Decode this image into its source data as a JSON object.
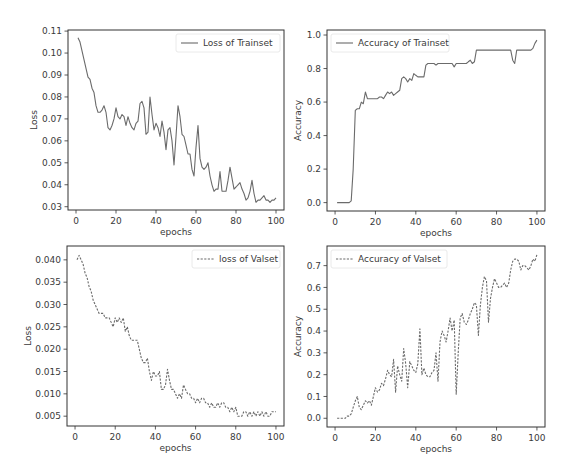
{
  "chart_data": [
    {
      "id": "train_loss",
      "type": "line",
      "title": "",
      "xlabel": "epochs",
      "ylabel": "Loss",
      "legend": {
        "label": "Loss of Trainset",
        "position": "upper right",
        "linestyle": "solid"
      },
      "xlim": [
        -4,
        104
      ],
      "ylim": [
        0.0285,
        0.1105
      ],
      "xticks": [
        0,
        20,
        40,
        60,
        80,
        100
      ],
      "yticks": [
        0.03,
        0.04,
        0.05,
        0.06,
        0.07,
        0.08,
        0.09,
        0.1,
        0.11
      ],
      "ytick_labels": [
        "0.03",
        "0.04",
        "0.05",
        "0.06",
        "0.07",
        "0.08",
        "0.09",
        "0.10",
        "0.11"
      ],
      "grid": false,
      "series": [
        {
          "name": "Loss of Trainset",
          "x": [
            1,
            2,
            3,
            4,
            5,
            6,
            7,
            8,
            9,
            10,
            11,
            12,
            13,
            14,
            15,
            16,
            17,
            18,
            19,
            20,
            21,
            22,
            23,
            24,
            25,
            26,
            27,
            28,
            29,
            30,
            31,
            32,
            33,
            34,
            35,
            36,
            37,
            38,
            39,
            40,
            41,
            42,
            43,
            44,
            45,
            46,
            47,
            48,
            49,
            50,
            51,
            52,
            53,
            54,
            55,
            56,
            57,
            58,
            59,
            60,
            61,
            62,
            63,
            64,
            65,
            66,
            67,
            68,
            69,
            70,
            71,
            72,
            73,
            74,
            75,
            76,
            77,
            78,
            79,
            80,
            81,
            82,
            83,
            84,
            85,
            86,
            87,
            88,
            89,
            90,
            91,
            92,
            93,
            94,
            95,
            96,
            97,
            98,
            99,
            100
          ],
          "y": [
            0.107,
            0.105,
            0.101,
            0.097,
            0.093,
            0.089,
            0.088,
            0.084,
            0.082,
            0.076,
            0.073,
            0.073,
            0.074,
            0.076,
            0.073,
            0.066,
            0.065,
            0.067,
            0.07,
            0.075,
            0.071,
            0.07,
            0.072,
            0.071,
            0.067,
            0.071,
            0.068,
            0.066,
            0.065,
            0.068,
            0.069,
            0.077,
            0.078,
            0.075,
            0.063,
            0.064,
            0.08,
            0.072,
            0.065,
            0.068,
            0.066,
            0.062,
            0.069,
            0.064,
            0.056,
            0.065,
            0.066,
            0.06,
            0.049,
            0.062,
            0.076,
            0.071,
            0.063,
            0.062,
            0.058,
            0.054,
            0.054,
            0.047,
            0.044,
            0.057,
            0.067,
            0.052,
            0.048,
            0.047,
            0.048,
            0.05,
            0.044,
            0.04,
            0.037,
            0.038,
            0.038,
            0.046,
            0.037,
            0.037,
            0.037,
            0.042,
            0.048,
            0.043,
            0.038,
            0.039,
            0.04,
            0.041,
            0.038,
            0.036,
            0.033,
            0.034,
            0.037,
            0.042,
            0.036,
            0.032,
            0.033,
            0.033,
            0.034,
            0.035,
            0.033,
            0.033,
            0.032,
            0.033,
            0.033,
            0.034
          ]
        }
      ]
    },
    {
      "id": "train_acc",
      "type": "line",
      "title": "",
      "xlabel": "epochs",
      "ylabel": "Accuracy",
      "legend": {
        "label": "Accuracy of Trainset",
        "position": "upper left",
        "linestyle": "solid"
      },
      "xlim": [
        -4,
        104
      ],
      "ylim": [
        -0.05,
        1.03
      ],
      "xticks": [
        0,
        20,
        40,
        60,
        80,
        100
      ],
      "yticks": [
        0.0,
        0.2,
        0.4,
        0.6,
        0.8,
        1.0
      ],
      "ytick_labels": [
        "0.0",
        "0.2",
        "0.4",
        "0.6",
        "0.8",
        "1.0"
      ],
      "grid": false,
      "series": [
        {
          "name": "Accuracy of Trainset",
          "x": [
            1,
            2,
            3,
            4,
            5,
            6,
            7,
            8,
            9,
            10,
            11,
            12,
            13,
            14,
            15,
            16,
            17,
            18,
            19,
            20,
            21,
            22,
            23,
            24,
            25,
            26,
            27,
            28,
            29,
            30,
            31,
            32,
            33,
            34,
            35,
            36,
            37,
            38,
            39,
            40,
            41,
            42,
            43,
            44,
            45,
            46,
            47,
            48,
            49,
            50,
            51,
            52,
            53,
            54,
            55,
            56,
            57,
            58,
            59,
            60,
            61,
            62,
            63,
            64,
            65,
            66,
            67,
            68,
            69,
            70,
            71,
            72,
            73,
            74,
            75,
            76,
            77,
            78,
            79,
            80,
            81,
            82,
            83,
            84,
            85,
            86,
            87,
            88,
            89,
            90,
            91,
            92,
            93,
            94,
            95,
            96,
            97,
            98,
            99,
            100
          ],
          "y": [
            0.0,
            0.0,
            0.0,
            0.0,
            0.0,
            0.0,
            0.0,
            0.01,
            0.2,
            0.55,
            0.56,
            0.56,
            0.6,
            0.59,
            0.66,
            0.62,
            0.62,
            0.62,
            0.62,
            0.62,
            0.62,
            0.63,
            0.63,
            0.62,
            0.64,
            0.66,
            0.65,
            0.66,
            0.64,
            0.65,
            0.66,
            0.67,
            0.74,
            0.75,
            0.74,
            0.72,
            0.74,
            0.73,
            0.77,
            0.76,
            0.75,
            0.75,
            0.75,
            0.75,
            0.82,
            0.83,
            0.83,
            0.83,
            0.83,
            0.82,
            0.83,
            0.83,
            0.83,
            0.83,
            0.83,
            0.83,
            0.83,
            0.83,
            0.81,
            0.83,
            0.83,
            0.83,
            0.83,
            0.83,
            0.83,
            0.84,
            0.85,
            0.83,
            0.84,
            0.91,
            0.91,
            0.91,
            0.91,
            0.91,
            0.91,
            0.91,
            0.91,
            0.91,
            0.91,
            0.91,
            0.91,
            0.91,
            0.91,
            0.91,
            0.91,
            0.91,
            0.91,
            0.85,
            0.83,
            0.91,
            0.91,
            0.91,
            0.91,
            0.91,
            0.91,
            0.91,
            0.91,
            0.92,
            0.95,
            0.97
          ]
        }
      ]
    },
    {
      "id": "val_loss",
      "type": "line",
      "title": "",
      "xlabel": "epochs",
      "ylabel": "Loss",
      "legend": {
        "label": "loss of Valset",
        "position": "upper right",
        "linestyle": "dashed"
      },
      "xlim": [
        -4,
        104
      ],
      "ylim": [
        0.0028,
        0.0431
      ],
      "xticks": [
        0,
        20,
        40,
        60,
        80,
        100
      ],
      "yticks": [
        0.005,
        0.01,
        0.015,
        0.02,
        0.025,
        0.03,
        0.035,
        0.04
      ],
      "ytick_labels": [
        "0.005",
        "0.010",
        "0.015",
        "0.020",
        "0.025",
        "0.030",
        "0.035",
        "0.040"
      ],
      "grid": false,
      "series": [
        {
          "name": "loss of Valset",
          "x": [
            1,
            2,
            3,
            4,
            5,
            6,
            7,
            8,
            9,
            10,
            11,
            12,
            13,
            14,
            15,
            16,
            17,
            18,
            19,
            20,
            21,
            22,
            23,
            24,
            25,
            26,
            27,
            28,
            29,
            30,
            31,
            32,
            33,
            34,
            35,
            36,
            37,
            38,
            39,
            40,
            41,
            42,
            43,
            44,
            45,
            46,
            47,
            48,
            49,
            50,
            51,
            52,
            53,
            54,
            55,
            56,
            57,
            58,
            59,
            60,
            61,
            62,
            63,
            64,
            65,
            66,
            67,
            68,
            69,
            70,
            71,
            72,
            73,
            74,
            75,
            76,
            77,
            78,
            79,
            80,
            81,
            82,
            83,
            84,
            85,
            86,
            87,
            88,
            89,
            90,
            91,
            92,
            93,
            94,
            95,
            96,
            97,
            98,
            99,
            100
          ],
          "y": [
            0.04,
            0.041,
            0.04,
            0.039,
            0.037,
            0.036,
            0.034,
            0.033,
            0.031,
            0.03,
            0.029,
            0.028,
            0.028,
            0.028,
            0.027,
            0.027,
            0.027,
            0.026,
            0.025,
            0.027,
            0.026,
            0.027,
            0.026,
            0.027,
            0.024,
            0.025,
            0.023,
            0.022,
            0.022,
            0.022,
            0.022,
            0.02,
            0.018,
            0.017,
            0.017,
            0.018,
            0.015,
            0.013,
            0.015,
            0.014,
            0.014,
            0.015,
            0.011,
            0.011,
            0.012,
            0.0155,
            0.013,
            0.011,
            0.011,
            0.01,
            0.009,
            0.01,
            0.009,
            0.012,
            0.011,
            0.01,
            0.01,
            0.009,
            0.009,
            0.008,
            0.009,
            0.008,
            0.009,
            0.009,
            0.008,
            0.008,
            0.007,
            0.008,
            0.007,
            0.007,
            0.008,
            0.007,
            0.008,
            0.008,
            0.007,
            0.007,
            0.006,
            0.007,
            0.006,
            0.007,
            0.005,
            0.005,
            0.005,
            0.006,
            0.006,
            0.005,
            0.006,
            0.005,
            0.006,
            0.005,
            0.006,
            0.005,
            0.006,
            0.005,
            0.006,
            0.005,
            0.005,
            0.006,
            0.006,
            0.006
          ]
        }
      ]
    },
    {
      "id": "val_acc",
      "type": "line",
      "title": "",
      "xlabel": "epochs",
      "ylabel": "Accuracy",
      "legend": {
        "label": "Accuracy of Valset",
        "position": "upper left",
        "linestyle": "dashed"
      },
      "xlim": [
        -4,
        104
      ],
      "ylim": [
        -0.04,
        0.79
      ],
      "xticks": [
        0,
        20,
        40,
        60,
        80,
        100
      ],
      "yticks": [
        0.0,
        0.1,
        0.2,
        0.3,
        0.4,
        0.5,
        0.6,
        0.7
      ],
      "ytick_labels": [
        "0.0",
        "0.1",
        "0.2",
        "0.3",
        "0.4",
        "0.5",
        "0.6",
        "0.7"
      ],
      "grid": false,
      "series": [
        {
          "name": "Accuracy of Valset",
          "x": [
            1,
            2,
            3,
            4,
            5,
            6,
            7,
            8,
            9,
            10,
            11,
            12,
            13,
            14,
            15,
            16,
            17,
            18,
            19,
            20,
            21,
            22,
            23,
            24,
            25,
            26,
            27,
            28,
            29,
            30,
            31,
            32,
            33,
            34,
            35,
            36,
            37,
            38,
            39,
            40,
            41,
            42,
            43,
            44,
            45,
            46,
            47,
            48,
            49,
            50,
            51,
            52,
            53,
            54,
            55,
            56,
            57,
            58,
            59,
            60,
            61,
            62,
            63,
            64,
            65,
            66,
            67,
            68,
            69,
            70,
            71,
            72,
            73,
            74,
            75,
            76,
            77,
            78,
            79,
            80,
            81,
            82,
            83,
            84,
            85,
            86,
            87,
            88,
            89,
            90,
            91,
            92,
            93,
            94,
            95,
            96,
            97,
            98,
            99,
            100
          ],
          "y": [
            0.0,
            0.0,
            0.0,
            0.0,
            0.0,
            0.01,
            0.01,
            0.02,
            0.05,
            0.08,
            0.1,
            0.05,
            0.04,
            0.06,
            0.08,
            0.07,
            0.08,
            0.06,
            0.1,
            0.14,
            0.12,
            0.13,
            0.16,
            0.15,
            0.18,
            0.22,
            0.2,
            0.19,
            0.27,
            0.12,
            0.24,
            0.2,
            0.17,
            0.32,
            0.25,
            0.14,
            0.26,
            0.24,
            0.22,
            0.21,
            0.25,
            0.41,
            0.2,
            0.23,
            0.2,
            0.19,
            0.19,
            0.21,
            0.22,
            0.3,
            0.17,
            0.35,
            0.4,
            0.38,
            0.35,
            0.4,
            0.46,
            0.4,
            0.45,
            0.11,
            0.3,
            0.46,
            0.48,
            0.44,
            0.43,
            0.45,
            0.48,
            0.5,
            0.53,
            0.52,
            0.38,
            0.52,
            0.6,
            0.65,
            0.63,
            0.44,
            0.55,
            0.6,
            0.64,
            0.62,
            0.6,
            0.6,
            0.61,
            0.62,
            0.6,
            0.62,
            0.68,
            0.72,
            0.73,
            0.73,
            0.72,
            0.68,
            0.7,
            0.7,
            0.69,
            0.68,
            0.7,
            0.73,
            0.72,
            0.75
          ]
        }
      ]
    }
  ],
  "panels": [
    {
      "chart": 0,
      "frame": {
        "left": 68,
        "top": 30,
        "right": 284,
        "bottom": 210
      },
      "legend_box": {
        "x": 176,
        "y": 34,
        "w": 104,
        "h": 18
      }
    },
    {
      "chart": 1,
      "frame": {
        "left": 327,
        "top": 30,
        "right": 545,
        "bottom": 211
      },
      "legend_box": {
        "x": 331,
        "y": 34,
        "w": 118,
        "h": 18
      }
    },
    {
      "chart": 2,
      "frame": {
        "left": 67,
        "top": 246,
        "right": 284,
        "bottom": 426
      },
      "legend_box": {
        "x": 192,
        "y": 250,
        "w": 88,
        "h": 18
      }
    },
    {
      "chart": 3,
      "frame": {
        "left": 327,
        "top": 246,
        "right": 545,
        "bottom": 427
      },
      "legend_box": {
        "x": 331,
        "y": 250,
        "w": 116,
        "h": 18
      }
    }
  ],
  "style": {
    "line_color": "#6b6b6b",
    "axis_color": "#333333",
    "text_color": "#3a3a3a",
    "background": "#ffffff"
  }
}
